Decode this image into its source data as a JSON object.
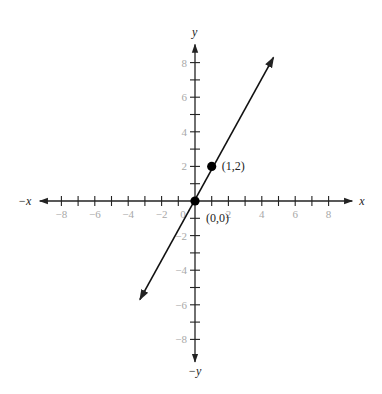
{
  "chart_data": {
    "type": "line",
    "title": "",
    "xlabel": "x",
    "ylabel": "y",
    "x_neg_label": "−x",
    "y_neg_label": "−y",
    "xlim": [
      -9,
      9
    ],
    "ylim": [
      -9,
      9
    ],
    "grid": false,
    "x_ticks": [
      -8,
      -6,
      -4,
      -2,
      0,
      2,
      4,
      6,
      8
    ],
    "y_ticks": [
      -8,
      -6,
      -4,
      -2,
      2,
      4,
      6,
      8
    ],
    "x_tick_labels": [
      "−8",
      "−6",
      "−4",
      "−2",
      "0",
      "2",
      "4",
      "6",
      "8"
    ],
    "y_tick_labels": [
      "−8",
      "−6",
      "−4",
      "−2",
      "2",
      "4",
      "6",
      "8"
    ],
    "series": [
      {
        "name": "y = 2x",
        "equation": "y = 2x",
        "x": [
          -3.3,
          4.7
        ],
        "y": [
          -5.7,
          8.3
        ],
        "arrows": "both",
        "color": "#111111"
      }
    ],
    "points": [
      {
        "x": 0,
        "y": 0,
        "label": "(0,0)"
      },
      {
        "x": 1,
        "y": 2,
        "label": "(1,2)"
      }
    ]
  },
  "layout": {
    "origin_px": [
      195,
      201
    ],
    "unit_px_x": 16.7,
    "unit_px_y": 17.3
  }
}
